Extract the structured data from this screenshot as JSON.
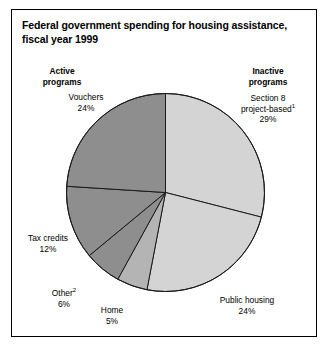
{
  "title": "Federal government spending for housing assistance, fiscal year 1999",
  "groups": {
    "active": "Active\nprograms",
    "active_line1": "Active",
    "active_line2": "programs",
    "inactive_line1": "Inactive",
    "inactive_line2": "programs"
  },
  "labels": {
    "vouchers_name": "Vouchers",
    "vouchers_value": "24%",
    "section8_line1": "Section 8",
    "section8_line2": "project-based",
    "section8_footnote": "1",
    "section8_value": "29%",
    "public_housing_name": "Public housing",
    "public_housing_value": "24%",
    "home_name": "Home",
    "home_value": "5%",
    "other_name": "Other",
    "other_footnote": "2",
    "other_value": "6%",
    "tax_credits_name": "Tax credits",
    "tax_credits_value": "12%"
  },
  "colors": {
    "light_gray": "#d4d4d4",
    "medium_gray": "#b4b4b4",
    "dark_gray": "#8e8e8e",
    "outline": "#1a1a1a",
    "frame": "#000000",
    "text": "#000000",
    "background": "#ffffff"
  },
  "chart_data": {
    "type": "pie",
    "title": "Federal government spending for housing assistance, fiscal year 1999",
    "xlabel": "",
    "ylabel": "",
    "legend_position": "annotated-callouts",
    "grid": false,
    "start_angle_deg": 0,
    "direction": "clockwise",
    "total": 100,
    "units": "percent",
    "group_labels": [
      "Inactive programs",
      "Active programs"
    ],
    "categories": [
      "Section 8 project-based",
      "Public housing",
      "Home",
      "Other",
      "Tax credits",
      "Vouchers"
    ],
    "values": [
      29,
      24,
      5,
      6,
      12,
      24
    ],
    "slices": [
      {
        "label": "Section 8 project-based",
        "value": 29,
        "group": "Inactive programs",
        "color": "#d4d4d4",
        "footnote": "1"
      },
      {
        "label": "Public housing",
        "value": 24,
        "group": "Inactive programs",
        "color": "#d4d4d4",
        "footnote": ""
      },
      {
        "label": "Home",
        "value": 5,
        "group": "Active programs",
        "color": "#b4b4b4",
        "footnote": ""
      },
      {
        "label": "Other",
        "value": 6,
        "group": "Active programs",
        "color": "#8e8e8e",
        "footnote": "2"
      },
      {
        "label": "Tax credits",
        "value": 12,
        "group": "Active programs",
        "color": "#8e8e8e",
        "footnote": ""
      },
      {
        "label": "Vouchers",
        "value": 24,
        "group": "Active programs",
        "color": "#8e8e8e",
        "footnote": ""
      }
    ]
  }
}
